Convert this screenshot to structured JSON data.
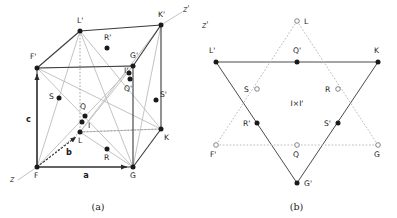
{
  "figure": {
    "panels": [
      {
        "id": "a",
        "caption": "(a)",
        "description": "Perspective view of a cube (unit cell) with labelled corner, edge-centre and interior sites",
        "axis_labels": [
          "z",
          "z'"
        ],
        "vectors": [
          "a",
          "b",
          "c"
        ],
        "point_labels": [
          "L'",
          "K'",
          "R'",
          "G'",
          "I'",
          "Q'",
          "S'",
          "F'",
          "S",
          "Q",
          "I",
          "L",
          "R",
          "K",
          "F",
          "G"
        ]
      },
      {
        "id": "b",
        "caption": "(b)",
        "description": "Projection along z' showing two interpenetrating triangles forming a star of David",
        "axis_labels": [
          "z'"
        ],
        "centre_label": "I×I'",
        "point_labels": [
          "L",
          "L'",
          "Q'",
          "K",
          "S",
          "R",
          "R'",
          "S'",
          "F'",
          "Q",
          "G",
          "G'"
        ]
      }
    ]
  },
  "panel_a": {
    "caption": "(a)",
    "axis_z": "z",
    "axis_zprime": "z'",
    "vector_a": "a",
    "vector_b": "b",
    "vector_c": "c",
    "points": [
      {
        "id": "Lp",
        "label": "L'",
        "x": 80,
        "y": 31,
        "fill": "solid",
        "lx": 77,
        "ly": 23
      },
      {
        "id": "Kp",
        "label": "K'",
        "x": 161,
        "y": 25,
        "fill": "solid",
        "lx": 158,
        "ly": 17
      },
      {
        "id": "Rp",
        "label": "R'",
        "x": 107,
        "y": 48,
        "fill": "solid",
        "lx": 104,
        "ly": 40
      },
      {
        "id": "Gp",
        "label": "G'",
        "x": 133,
        "y": 66,
        "fill": "solid",
        "lx": 130,
        "ly": 58
      },
      {
        "id": "Ip",
        "label": "I'",
        "x": 130,
        "y": 79,
        "fill": "solid",
        "lx": 124,
        "ly": 73
      },
      {
        "id": "Qp",
        "label": "Q'",
        "x": 129,
        "y": 73,
        "fill": "solid",
        "lx": 124,
        "ly": 91
      },
      {
        "id": "Sp",
        "label": "S'",
        "x": 156,
        "y": 100,
        "fill": "solid",
        "lx": 160,
        "ly": 97
      },
      {
        "id": "Fp",
        "label": "F'",
        "x": 37,
        "y": 68,
        "fill": "solid",
        "lx": 30,
        "ly": 59
      },
      {
        "id": "S",
        "label": "S",
        "x": 59,
        "y": 98,
        "fill": "solid",
        "lx": 49,
        "ly": 99
      },
      {
        "id": "Q",
        "label": "Q",
        "x": 85,
        "y": 116,
        "fill": "solid",
        "lx": 80,
        "ly": 109
      },
      {
        "id": "I",
        "label": "I",
        "x": 82,
        "y": 122,
        "fill": "solid",
        "lx": 88,
        "ly": 128
      },
      {
        "id": "L",
        "label": "L",
        "x": 80,
        "y": 132,
        "fill": "solid",
        "lx": 78,
        "ly": 143
      },
      {
        "id": "R",
        "label": "R",
        "x": 107,
        "y": 149,
        "fill": "solid",
        "lx": 104,
        "ly": 160
      },
      {
        "id": "K",
        "label": "K",
        "x": 161,
        "y": 129,
        "fill": "solid",
        "lx": 164,
        "ly": 140
      },
      {
        "id": "F",
        "label": "F",
        "x": 37,
        "y": 167,
        "fill": "solid",
        "lx": 34,
        "ly": 178
      },
      {
        "id": "G",
        "label": "G",
        "x": 133,
        "y": 167,
        "fill": "solid",
        "lx": 130,
        "ly": 178
      }
    ]
  },
  "panel_b": {
    "caption": "(b)",
    "axis_zprime": "z'",
    "centre_label": "I×I'",
    "points": [
      {
        "id": "L",
        "label": "L",
        "x": 101,
        "y": 21,
        "fill": "open",
        "lx": 108,
        "ly": 24
      },
      {
        "id": "Lp",
        "label": "L'",
        "x": 20,
        "y": 62,
        "fill": "solid",
        "lx": 13,
        "ly": 53
      },
      {
        "id": "Qp",
        "label": "Q'",
        "x": 101,
        "y": 62,
        "fill": "solid",
        "lx": 97,
        "ly": 53
      },
      {
        "id": "K",
        "label": "K",
        "x": 182,
        "y": 62,
        "fill": "solid",
        "lx": 178,
        "ly": 53
      },
      {
        "id": "S",
        "label": "S",
        "x": 61,
        "y": 89,
        "fill": "open",
        "lx": 48,
        "ly": 92
      },
      {
        "id": "R",
        "label": "R",
        "x": 142,
        "y": 89,
        "fill": "open",
        "lx": 129,
        "ly": 92
      },
      {
        "id": "Rp",
        "label": "R'",
        "x": 61,
        "y": 123,
        "fill": "solid",
        "lx": 47,
        "ly": 126
      },
      {
        "id": "Sp",
        "label": "S'",
        "x": 142,
        "y": 123,
        "fill": "solid",
        "lx": 128,
        "ly": 126
      },
      {
        "id": "Fp",
        "label": "F'",
        "x": 20,
        "y": 145,
        "fill": "open",
        "lx": 14,
        "ly": 157
      },
      {
        "id": "Q",
        "label": "Q",
        "x": 101,
        "y": 145,
        "fill": "open",
        "lx": 97,
        "ly": 157
      },
      {
        "id": "G",
        "label": "G",
        "x": 182,
        "y": 145,
        "fill": "open",
        "lx": 178,
        "ly": 157
      },
      {
        "id": "Gp",
        "label": "G'",
        "x": 101,
        "y": 183,
        "fill": "solid",
        "lx": 108,
        "ly": 186
      }
    ]
  },
  "colors": {
    "ink": "#1a1a1a",
    "line_dark": "#3a3a3a",
    "line_light": "#b0b0b0",
    "line_dotted": "#9a9a9a",
    "background": "#ffffff"
  }
}
